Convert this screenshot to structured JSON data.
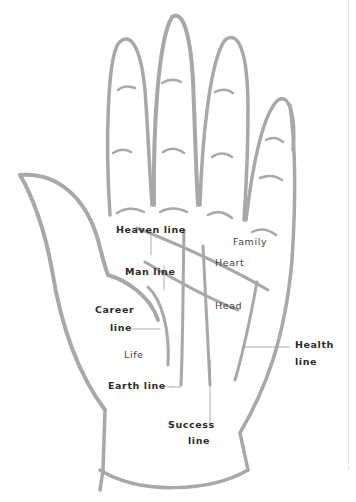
{
  "diagram": {
    "stroke_color": "#a8a8a8",
    "text_color": "#2b2b2b",
    "labels": {
      "heaven_line": "Heaven line",
      "family": "Family",
      "heart": "Heart",
      "man_line": "Man line",
      "head": "Head",
      "career_line_1": "Career",
      "career_line_2": "line",
      "life": "Life",
      "health_line_1": "Health",
      "health_line_2": "line",
      "earth_line": "Earth line",
      "success_line_1": "Success",
      "success_line_2": "line"
    }
  }
}
